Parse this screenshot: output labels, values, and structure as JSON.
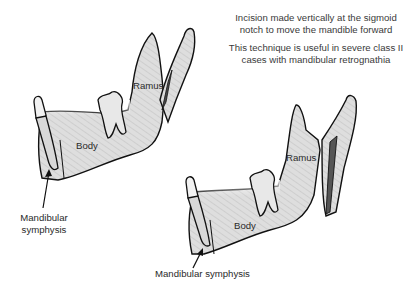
{
  "captions": {
    "line1": "Incision made vertically at the sigmoid",
    "line2": "notch to move the mandible forward",
    "line3": "This technique is useful in severe class II",
    "line4": "cases with mandibular retrognathia"
  },
  "before": {
    "ramus_label": "Ramus",
    "body_label": "Body",
    "symphysis_label_line1": "Mandibular",
    "symphysis_label_line2": "symphysis"
  },
  "after": {
    "ramus_label": "Ramus",
    "body_label": "Body",
    "symphysis_label": "Mandibular symphysis"
  },
  "colors": {
    "bone_fill": "#dcdcdc",
    "tooth_fill": "#e4e4e4",
    "outline": "#111111",
    "incision_fill": "#555555"
  }
}
